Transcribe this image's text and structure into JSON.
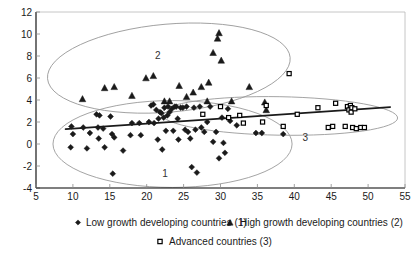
{
  "chart_data": {
    "type": "scatter",
    "title": "",
    "xlabel": "",
    "ylabel": "",
    "xlim": [
      5,
      55
    ],
    "ylim": [
      -4,
      12
    ],
    "xticks": [
      5,
      10,
      15,
      20,
      25,
      30,
      35,
      40,
      45,
      50,
      55
    ],
    "yticks": [
      -4,
      -2,
      0,
      2,
      4,
      6,
      8,
      10,
      12
    ],
    "grid": false,
    "legend_position": "bottom",
    "annotations": [
      {
        "label": "1",
        "x": 22.5,
        "y": -2.6
      },
      {
        "label": "2",
        "x": 21.5,
        "y": 8.1
      },
      {
        "label": "3",
        "x": 41.5,
        "y": 0.65
      }
    ],
    "series": [
      {
        "name": "Low growth developing countries (1)",
        "marker": "diamond",
        "legend_index": 1,
        "points": [
          [
            9.8,
            1.6
          ],
          [
            10.0,
            0.9
          ],
          [
            9.7,
            -0.3
          ],
          [
            11.4,
            1.5
          ],
          [
            11.9,
            -0.4
          ],
          [
            12.3,
            1.0
          ],
          [
            13.2,
            2.7
          ],
          [
            13.6,
            2.6
          ],
          [
            13.4,
            1.5
          ],
          [
            13.5,
            0.5
          ],
          [
            14.1,
            1.4
          ],
          [
            14.3,
            -0.3
          ],
          [
            15.1,
            2.5
          ],
          [
            15.3,
            0.9
          ],
          [
            15.4,
            -2.7
          ],
          [
            15.6,
            0.6
          ],
          [
            16.8,
            -0.6
          ],
          [
            17.8,
            0.8
          ],
          [
            18.0,
            1.9
          ],
          [
            19.0,
            1.9
          ],
          [
            19.2,
            0.8
          ],
          [
            20.3,
            2.0
          ],
          [
            20.6,
            3.5
          ],
          [
            20.9,
            3.6
          ],
          [
            21.0,
            1.9
          ],
          [
            21.3,
            3.1
          ],
          [
            21.5,
            0.4
          ],
          [
            21.6,
            2.3
          ],
          [
            21.8,
            2.9
          ],
          [
            22.0,
            2.8
          ],
          [
            22.1,
            -0.5
          ],
          [
            22.3,
            2.4
          ],
          [
            22.4,
            3.3
          ],
          [
            22.6,
            1.2
          ],
          [
            22.8,
            2.6
          ],
          [
            22.9,
            3.4
          ],
          [
            23.1,
            2.9
          ],
          [
            23.4,
            3.2
          ],
          [
            23.6,
            1.2
          ],
          [
            23.8,
            3.4
          ],
          [
            24.0,
            3.4
          ],
          [
            24.2,
            2.3
          ],
          [
            24.3,
            0.4
          ],
          [
            24.6,
            3.3
          ],
          [
            24.9,
            3.3
          ],
          [
            25.2,
            1.3
          ],
          [
            25.4,
            3.4
          ],
          [
            25.6,
            1.1
          ],
          [
            25.9,
            0.5
          ],
          [
            26.1,
            -2.1
          ],
          [
            26.4,
            3.3
          ],
          [
            26.6,
            1.3
          ],
          [
            26.8,
            -2.6
          ],
          [
            27.2,
            3.4
          ],
          [
            27.4,
            1.5
          ],
          [
            27.8,
            1.1
          ],
          [
            28.2,
            2.0
          ],
          [
            28.6,
            3.4
          ],
          [
            29.0,
            0.2
          ],
          [
            29.4,
            1.1
          ],
          [
            29.8,
            -1.3
          ],
          [
            30.2,
            2.4
          ],
          [
            30.4,
            0.1
          ],
          [
            30.6,
            -0.8
          ],
          [
            31.0,
            3.2
          ],
          [
            31.3,
            2.1
          ],
          [
            32.2,
            1.7
          ],
          [
            34.8,
            1.0
          ],
          [
            35.6,
            1.0
          ],
          [
            38.5,
            0.9
          ]
        ]
      },
      {
        "name": "High growth developing countries (2)",
        "marker": "triangle",
        "legend_index": 2,
        "points": [
          [
            11.3,
            4.1
          ],
          [
            14.3,
            5.1
          ],
          [
            15.6,
            5.2
          ],
          [
            18.0,
            4.4
          ],
          [
            19.9,
            6.0
          ],
          [
            20.9,
            6.2
          ],
          [
            22.4,
            3.9
          ],
          [
            23.1,
            3.9
          ],
          [
            24.4,
            5.3
          ],
          [
            25.4,
            4.3
          ],
          [
            26.3,
            4.7
          ],
          [
            27.4,
            5.2
          ],
          [
            28.2,
            3.9
          ],
          [
            28.4,
            5.6
          ],
          [
            29.0,
            8.3
          ],
          [
            29.6,
            9.6
          ],
          [
            29.8,
            10.1
          ],
          [
            30.1,
            7.6
          ],
          [
            31.5,
            3.9
          ],
          [
            33.9,
            5.2
          ],
          [
            36.0,
            3.8
          ],
          [
            36.2,
            3.1
          ]
        ]
      },
      {
        "name": "Advanced countries (3)",
        "marker": "square",
        "legend_index": 3,
        "points": [
          [
            27.6,
            2.7
          ],
          [
            30.0,
            3.4
          ],
          [
            31.1,
            2.4
          ],
          [
            32.6,
            2.6
          ],
          [
            33.1,
            1.9
          ],
          [
            35.7,
            2.0
          ],
          [
            36.2,
            3.5
          ],
          [
            38.5,
            1.6
          ],
          [
            39.3,
            6.4
          ],
          [
            40.4,
            2.7
          ],
          [
            43.2,
            3.3
          ],
          [
            44.6,
            1.5
          ],
          [
            45.2,
            1.6
          ],
          [
            45.6,
            3.7
          ],
          [
            46.9,
            1.6
          ],
          [
            47.2,
            3.4
          ],
          [
            47.4,
            3.1
          ],
          [
            47.6,
            3.5
          ],
          [
            47.7,
            2.9
          ],
          [
            47.8,
            3.3
          ],
          [
            47.9,
            1.5
          ],
          [
            48.2,
            3.2
          ],
          [
            48.4,
            1.4
          ],
          [
            49.0,
            1.5
          ],
          [
            49.5,
            1.5
          ]
        ]
      }
    ],
    "trend_line": {
      "name": "overall-regression",
      "x_start": 9.0,
      "y_start": 1.35,
      "x_end": 53.0,
      "y_end": 3.35
    },
    "ellipses": [
      {
        "group": "1",
        "cx": 23.5,
        "cy": 0.0,
        "rx": 16.2,
        "ry": 3.95,
        "rotation": 0
      },
      {
        "group": "2",
        "cx": 23.0,
        "cy": 6.9,
        "rx": 16.5,
        "ry": 4.0,
        "rotation": -5
      },
      {
        "group": "3",
        "cx": 38.0,
        "cy": 2.55,
        "rx": 16.0,
        "ry": 1.75,
        "rotation": 1
      }
    ]
  },
  "legend": {
    "items": [
      {
        "label": "Low growth developing countries (1)",
        "marker": "diamond"
      },
      {
        "label": "High growth developing countries (2)",
        "marker": "triangle"
      },
      {
        "label": "Advanced countries (3)",
        "marker": "square"
      }
    ]
  },
  "colors": {
    "marker": "#1a1a1a",
    "square_fill": "#ffffff",
    "ellipse": "#9a9a9a",
    "trend": "#1a1a1a",
    "axis": "#000000",
    "frame": "#b8b8b8"
  }
}
